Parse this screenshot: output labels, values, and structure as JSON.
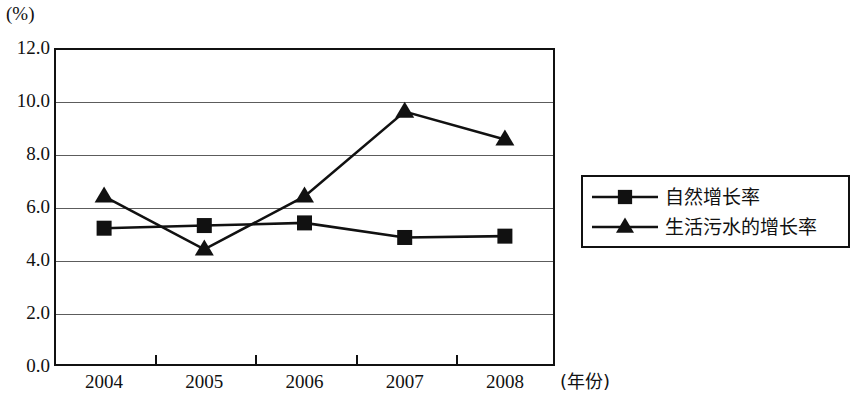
{
  "chart_data": {
    "type": "line",
    "title": "",
    "subtitle": "",
    "xlabel": "(年份)",
    "ylabel": "(%)",
    "categories": [
      "2004",
      "2005",
      "2006",
      "2007",
      "2008"
    ],
    "ylim": [
      0.0,
      12.0
    ],
    "ytick_labels": [
      "12.0",
      "10.0",
      "8.0",
      "6.0",
      "4.0",
      "2.0",
      "0.0"
    ],
    "ytick_values": [
      12.0,
      10.0,
      8.0,
      6.0,
      4.0,
      2.0,
      0.0
    ],
    "grid": true,
    "grid_axis": "y",
    "legend_position": "right",
    "series": [
      {
        "name": "自然增长率",
        "marker": "square",
        "color": "#111111",
        "values": [
          5.2,
          5.3,
          5.4,
          4.85,
          4.9
        ]
      },
      {
        "name": "生活污水的增长率",
        "marker": "triangle",
        "color": "#111111",
        "values": [
          6.4,
          4.4,
          6.4,
          9.6,
          8.55
        ]
      }
    ]
  },
  "axes": {
    "y_unit_label": "(%)",
    "x_unit_label": "(年份)"
  },
  "legend": {
    "entries": [
      {
        "label": "自然增长率",
        "marker": "square-marker"
      },
      {
        "label": "生活污水的增长率",
        "marker": "triangle-marker"
      }
    ]
  }
}
